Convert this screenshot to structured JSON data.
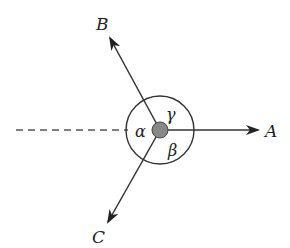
{
  "diagram": {
    "type": "vector-angles",
    "center": {
      "x": 160,
      "y": 130
    },
    "circle_radius": 34,
    "dot_radius": 8,
    "colors": {
      "line": "#333333",
      "dot": "#888888",
      "dashed": "#555555"
    },
    "vectors": [
      {
        "name": "A",
        "label": "A",
        "direction": "right"
      },
      {
        "name": "B",
        "label": "B",
        "direction": "upper-left"
      },
      {
        "name": "C",
        "label": "C",
        "direction": "lower-left"
      }
    ],
    "angles": [
      {
        "name": "alpha",
        "label": "α"
      },
      {
        "name": "beta",
        "label": "β"
      },
      {
        "name": "gamma",
        "label": "γ"
      }
    ],
    "reference_line": "dashed horizontal extension of A to the left"
  }
}
